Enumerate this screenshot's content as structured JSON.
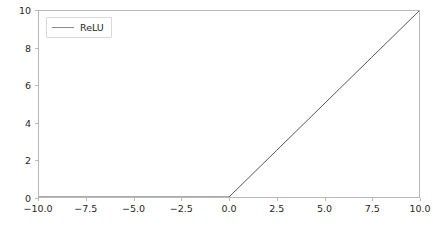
{
  "chart_data": {
    "type": "line",
    "title": "",
    "xlabel": "",
    "ylabel": "",
    "xlim": [
      -10.0,
      10.0
    ],
    "ylim": [
      0,
      10
    ],
    "grid": false,
    "legend_position": "upper left",
    "xticks": [
      -10.0,
      -7.5,
      -5.0,
      -2.5,
      0.0,
      2.5,
      5.0,
      7.5,
      10.0
    ],
    "xticklabels": [
      "−10.0",
      "−7.5",
      "−5.0",
      "−2.5",
      "0.0",
      "2.5",
      "5.0",
      "7.5",
      "10.0"
    ],
    "yticks": [
      0,
      2,
      4,
      6,
      8,
      10
    ],
    "yticklabels": [
      "0",
      "2",
      "4",
      "6",
      "8",
      "10"
    ],
    "series": [
      {
        "name": "ReLU",
        "color": "#555555",
        "linewidth": 1.0,
        "x": [
          -10.0,
          -7.5,
          -5.0,
          -2.5,
          0.0,
          2.5,
          5.0,
          7.5,
          10.0
        ],
        "values": [
          0,
          0,
          0,
          0,
          0,
          2.5,
          5.0,
          7.5,
          10.0
        ]
      }
    ],
    "legend": [
      "ReLU"
    ]
  },
  "legend": {
    "entries": [
      {
        "label": "ReLU",
        "color": "#8a8a8a"
      }
    ]
  },
  "style": {
    "background": "#ffffff",
    "spine_color": "#b8b8b8",
    "tick_color": "#b8b8b8",
    "text_color": "#262626",
    "line_color": "#555555"
  }
}
